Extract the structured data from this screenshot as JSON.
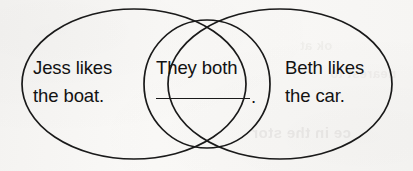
{
  "worksheet": {
    "type": "venn-diagram",
    "background_color": "#f7f6f4",
    "stroke_color": "#1a1a1a",
    "text_color": "#121212",
    "left_circle": {
      "label_line_1": "Jess likes",
      "label_line_2": "the boat."
    },
    "center_overlap": {
      "label_line_1": "They both",
      "blank_line": " ",
      "period": "."
    },
    "right_circle": {
      "label_line_1": "Beth likes",
      "label_line_2": "the car."
    },
    "page_bleed": {
      "line_1": "ce in the stor",
      "line_2": "ok at",
      "line_3": "nearest to"
    }
  }
}
